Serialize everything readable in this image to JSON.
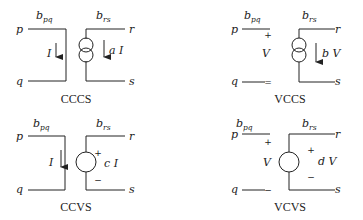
{
  "diagram": {
    "panels": [
      {
        "id": "ccss",
        "caption": "CCCS",
        "source_shape": "current-source",
        "control_label": "I",
        "output_label": "a I",
        "branch_ctrl": "b",
        "branch_ctrl_sub": "pq",
        "branch_out": "b",
        "branch_out_sub": "rs",
        "nodes": [
          "p",
          "q",
          "r",
          "s"
        ]
      },
      {
        "id": "vccs",
        "caption": "VCCS",
        "source_shape": "current-source",
        "control_label": "V",
        "control_plus": "+",
        "control_minus": "=",
        "output_label": "b V",
        "branch_ctrl": "b",
        "branch_ctrl_sub": "pq",
        "branch_out": "b",
        "branch_out_sub": "rs",
        "nodes": [
          "p",
          "q",
          "r",
          "s"
        ]
      },
      {
        "id": "ccvs",
        "caption": "CCVS",
        "source_shape": "voltage-source",
        "control_label": "I",
        "output_label": "c I",
        "output_plus": "+",
        "output_minus": "−",
        "branch_ctrl": "b",
        "branch_ctrl_sub": "pq",
        "branch_out": "b",
        "branch_out_sub": "rs",
        "nodes": [
          "p",
          "q",
          "r",
          "s"
        ]
      },
      {
        "id": "vcvs",
        "caption": "VCVS",
        "source_shape": "voltage-source",
        "control_label": "V",
        "control_plus": "+",
        "control_minus": "−",
        "output_label": "d V",
        "output_plus": "+",
        "output_minus": "−",
        "branch_ctrl": "b",
        "branch_ctrl_sub": "pq",
        "branch_out": "b",
        "branch_out_sub": "rs",
        "nodes": [
          "p",
          "q",
          "r",
          "s"
        ]
      }
    ]
  }
}
